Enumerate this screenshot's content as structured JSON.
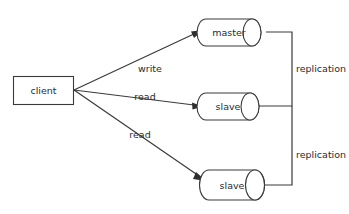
{
  "diagram": {
    "background_color": "#ffffff",
    "stroke_color": "#3a3a3a",
    "text_color": "#2b2b2b",
    "nodes": [
      {
        "id": "client",
        "label": "client",
        "shape": "rectangle"
      },
      {
        "id": "master",
        "label": "master",
        "shape": "cylinder"
      },
      {
        "id": "slave_1",
        "label": "slave",
        "shape": "cylinder"
      },
      {
        "id": "slave_2",
        "label": "slave",
        "shape": "cylinder"
      }
    ],
    "edges": [
      {
        "id": "client-to-master",
        "from": "client",
        "to": "master",
        "label": "write"
      },
      {
        "id": "client-to-slave-1",
        "from": "client",
        "to": "slave_1",
        "label": "read"
      },
      {
        "id": "client-to-slave-2",
        "from": "client",
        "to": "slave_2",
        "label": "read"
      },
      {
        "id": "master-to-slave-1",
        "from": "master",
        "to": "slave_1",
        "label": "replication"
      },
      {
        "id": "master-to-slave-2",
        "from": "master",
        "to": "slave_2",
        "label": "replication"
      }
    ]
  }
}
